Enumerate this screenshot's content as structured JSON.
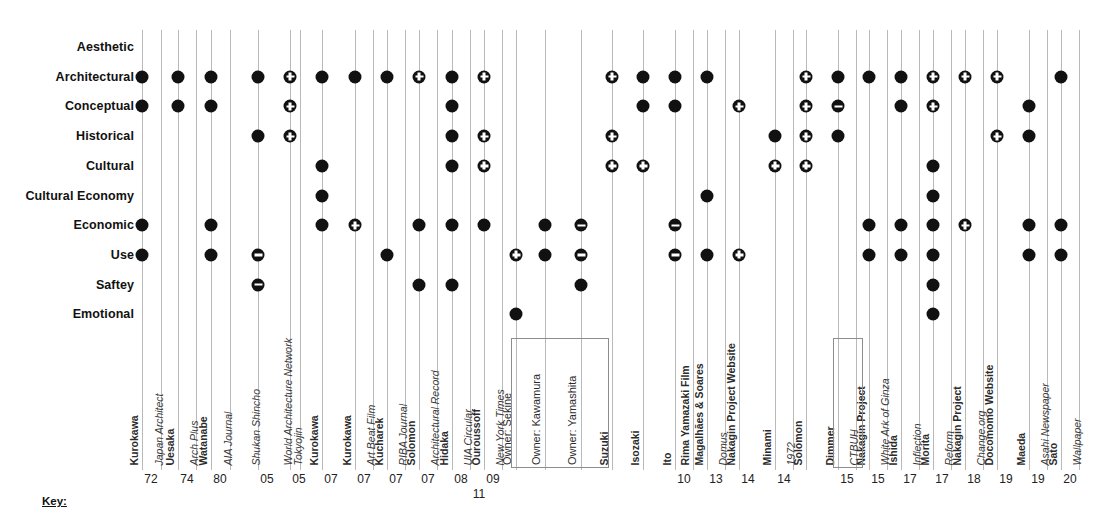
{
  "chart_data": {
    "type": "scatter",
    "title": "",
    "xlabel": "",
    "ylabel": "",
    "grid": true,
    "legend": "none",
    "rows": [
      "Aesthetic",
      "Architectural",
      "Conceptual",
      "Historical",
      "Cultural",
      "Cultural Economy",
      "Economic",
      "Use",
      "Saftey",
      "Emotional"
    ],
    "marker_types": {
      "filled": "filled circle",
      "plus": "circle with plus",
      "minus": "circle with minus"
    },
    "columns": [
      {
        "person": "Kurokawa",
        "source": "",
        "year": "72",
        "x": 142,
        "points": [
          {
            "row": "Architectural",
            "marker": "filled"
          },
          {
            "row": "Conceptual",
            "marker": "filled"
          },
          {
            "row": "Economic",
            "marker": "filled"
          },
          {
            "row": "Use",
            "marker": "filled"
          }
        ]
      },
      {
        "person": "",
        "source": "Japan Architect",
        "year": "",
        "x": 161,
        "points": []
      },
      {
        "person": "Uesaka",
        "source": "",
        "year": "74",
        "x": 178,
        "points": [
          {
            "row": "Architectural",
            "marker": "filled"
          },
          {
            "row": "Conceptual",
            "marker": "filled"
          }
        ]
      },
      {
        "person": "",
        "source": "Arch Plus",
        "year": "",
        "x": 196,
        "points": []
      },
      {
        "person": "Watanabe",
        "source": "",
        "year": "80",
        "x": 211,
        "points": [
          {
            "row": "Architectural",
            "marker": "filled"
          },
          {
            "row": "Conceptual",
            "marker": "filled"
          },
          {
            "row": "Economic",
            "marker": "filled"
          },
          {
            "row": "Use",
            "marker": "filled"
          }
        ]
      },
      {
        "person": "",
        "source": "AIA Journal",
        "year": "",
        "x": 230,
        "points": []
      },
      {
        "person": "",
        "source": "Shukan Shincho",
        "year": "05",
        "x": 258,
        "points": [
          {
            "row": "Architectural",
            "marker": "filled"
          },
          {
            "row": "Historical",
            "marker": "filled"
          },
          {
            "row": "Use",
            "marker": "minus"
          },
          {
            "row": "Saftey",
            "marker": "minus"
          }
        ]
      },
      {
        "person": "",
        "source": "World Architecture Network",
        "year": "05",
        "x": 290,
        "points": [
          {
            "row": "Architectural",
            "marker": "plus"
          },
          {
            "row": "Conceptual",
            "marker": "plus"
          },
          {
            "row": "Historical",
            "marker": "plus"
          }
        ]
      },
      {
        "person": "Kurokawa",
        "source": "",
        "year": "07",
        "x": 322,
        "points": [
          {
            "row": "Architectural",
            "marker": "filled"
          },
          {
            "row": "Cultural",
            "marker": "filled"
          },
          {
            "row": "Cultural Economy",
            "marker": "filled"
          },
          {
            "row": "Economic",
            "marker": "filled"
          }
        ]
      },
      {
        "person": "",
        "source": "Tokyojin",
        "year": "",
        "x": 300,
        "points": []
      },
      {
        "person": "Kurokawa",
        "source": "",
        "year": "07",
        "x": 355,
        "points": [
          {
            "row": "Architectural",
            "marker": "filled"
          },
          {
            "row": "Economic",
            "marker": "plus"
          }
        ]
      },
      {
        "person": "",
        "source": "Art Beat Film",
        "year": "",
        "x": 373,
        "points": []
      },
      {
        "person": "Kucharek",
        "source": "",
        "year": "07",
        "x": 387,
        "points": [
          {
            "row": "Architectural",
            "marker": "filled"
          },
          {
            "row": "Use",
            "marker": "filled"
          }
        ]
      },
      {
        "person": "",
        "source": "RIBA Journal",
        "year": "",
        "x": 405,
        "points": []
      },
      {
        "person": "Solomon",
        "source": "",
        "year": "07",
        "x": 419,
        "points": [
          {
            "row": "Architectural",
            "marker": "plus"
          },
          {
            "row": "Economic",
            "marker": "filled"
          },
          {
            "row": "Saftey",
            "marker": "filled"
          }
        ]
      },
      {
        "person": "",
        "source": "Architectural Record",
        "year": "",
        "x": 437,
        "points": []
      },
      {
        "person": "Hidaka",
        "source": "",
        "year": "08",
        "x": 452,
        "points": [
          {
            "row": "Architectural",
            "marker": "filled"
          },
          {
            "row": "Conceptual",
            "marker": "filled"
          },
          {
            "row": "Historical",
            "marker": "filled"
          },
          {
            "row": "Cultural",
            "marker": "filled"
          },
          {
            "row": "Economic",
            "marker": "filled"
          },
          {
            "row": "Saftey",
            "marker": "filled"
          }
        ]
      },
      {
        "person": "",
        "source": "UIA Circular",
        "year": "11",
        "x": 470,
        "points": []
      },
      {
        "person": "Ouroussoff",
        "source": "",
        "year": "09",
        "x": 484,
        "points": [
          {
            "row": "Architectural",
            "marker": "plus"
          },
          {
            "row": "Historical",
            "marker": "plus"
          },
          {
            "row": "Cultural",
            "marker": "plus"
          },
          {
            "row": "Economic",
            "marker": "filled"
          }
        ]
      },
      {
        "person": "",
        "source": "New York Times",
        "year": "",
        "x": 502,
        "points": []
      },
      {
        "person": "Owner: Sekine",
        "source": "",
        "year": "",
        "x": 516,
        "points": [
          {
            "row": "Use",
            "marker": "plus"
          },
          {
            "row": "Emotional",
            "marker": "filled"
          }
        ]
      },
      {
        "person": "Owner: Kawamura",
        "source": "",
        "year": "",
        "x": 545,
        "points": [
          {
            "row": "Economic",
            "marker": "filled"
          },
          {
            "row": "Use",
            "marker": "filled"
          }
        ]
      },
      {
        "person": "Owner: Yamashita",
        "source": "",
        "year": "",
        "x": 581,
        "points": [
          {
            "row": "Economic",
            "marker": "minus"
          },
          {
            "row": "Use",
            "marker": "minus"
          },
          {
            "row": "Saftey",
            "marker": "filled"
          }
        ]
      },
      {
        "person": "Suzuki",
        "source": "",
        "year": "",
        "x": 612,
        "points": [
          {
            "row": "Architectural",
            "marker": "plus"
          },
          {
            "row": "Historical",
            "marker": "plus"
          },
          {
            "row": "Cultural",
            "marker": "plus"
          }
        ]
      },
      {
        "person": "Isozaki",
        "source": "",
        "year": "",
        "x": 643,
        "points": [
          {
            "row": "Architectural",
            "marker": "filled"
          },
          {
            "row": "Conceptual",
            "marker": "filled"
          },
          {
            "row": "Cultural",
            "marker": "plus"
          }
        ]
      },
      {
        "person": "Ito",
        "source": "",
        "year": "10",
        "x": 675,
        "points": [
          {
            "row": "Architectural",
            "marker": "filled"
          },
          {
            "row": "Conceptual",
            "marker": "filled"
          },
          {
            "row": "Economic",
            "marker": "minus"
          },
          {
            "row": "Use",
            "marker": "minus"
          }
        ]
      },
      {
        "person": "Rima Yamazaki Film",
        "source": "",
        "year": "",
        "x": 693,
        "points": []
      },
      {
        "person": "Magalhães & Soares",
        "source": "",
        "year": "13",
        "x": 707,
        "points": [
          {
            "row": "Architectural",
            "marker": "filled"
          },
          {
            "row": "Cultural Economy",
            "marker": "filled"
          },
          {
            "row": "Use",
            "marker": "filled"
          }
        ]
      },
      {
        "person": "",
        "source": "Domus",
        "year": "",
        "x": 725,
        "points": []
      },
      {
        "person": "Nakagin Project Website",
        "source": "",
        "year": "14",
        "x": 739,
        "points": [
          {
            "row": "Conceptual",
            "marker": "plus"
          },
          {
            "row": "Use",
            "marker": "plus"
          }
        ]
      },
      {
        "person": "Minami",
        "source": "",
        "year": "14",
        "x": 775,
        "points": [
          {
            "row": "Historical",
            "marker": "filled"
          },
          {
            "row": "Cultural",
            "marker": "plus"
          }
        ]
      },
      {
        "person": "",
        "source": "1972",
        "year": "",
        "x": 793,
        "points": []
      },
      {
        "person": "Solomon",
        "source": "",
        "year": "",
        "x": 806,
        "points": [
          {
            "row": "Architectural",
            "marker": "plus"
          },
          {
            "row": "Conceptual",
            "marker": "plus"
          },
          {
            "row": "Historical",
            "marker": "plus"
          },
          {
            "row": "Cultural",
            "marker": "plus"
          }
        ]
      },
      {
        "person": "Dimmer",
        "source": "",
        "year": "15",
        "x": 838,
        "points": [
          {
            "row": "Architectural",
            "marker": "filled"
          },
          {
            "row": "Conceptual",
            "marker": "minus"
          },
          {
            "row": "Historical",
            "marker": "filled"
          }
        ]
      },
      {
        "person": "",
        "source": "CTBUH",
        "year": "",
        "x": 856,
        "points": []
      },
      {
        "person": "Nakagin Project",
        "source": "",
        "year": "15",
        "x": 869,
        "points": [
          {
            "row": "Architectural",
            "marker": "filled"
          },
          {
            "row": "Economic",
            "marker": "filled"
          },
          {
            "row": "Use",
            "marker": "filled"
          }
        ]
      },
      {
        "person": "",
        "source": "White Ark of Ginza",
        "year": "",
        "x": 887,
        "points": []
      },
      {
        "person": "Ishida",
        "source": "",
        "year": "17",
        "x": 901,
        "points": [
          {
            "row": "Architectural",
            "marker": "filled"
          },
          {
            "row": "Conceptual",
            "marker": "filled"
          },
          {
            "row": "Economic",
            "marker": "filled"
          },
          {
            "row": "Use",
            "marker": "filled"
          }
        ]
      },
      {
        "person": "",
        "source": "Inflection",
        "year": "",
        "x": 919,
        "points": []
      },
      {
        "person": "Morita",
        "source": "",
        "year": "17",
        "x": 933,
        "points": [
          {
            "row": "Architectural",
            "marker": "plus"
          },
          {
            "row": "Conceptual",
            "marker": "plus"
          },
          {
            "row": "Cultural",
            "marker": "filled"
          },
          {
            "row": "Cultural Economy",
            "marker": "filled"
          },
          {
            "row": "Economic",
            "marker": "filled"
          },
          {
            "row": "Use",
            "marker": "filled"
          },
          {
            "row": "Saftey",
            "marker": "filled"
          },
          {
            "row": "Emotional",
            "marker": "filled"
          }
        ]
      },
      {
        "person": "",
        "source": "Reform",
        "year": "",
        "x": 951,
        "points": []
      },
      {
        "person": "Nakagin Project",
        "source": "",
        "year": "18",
        "x": 965,
        "points": [
          {
            "row": "Architectural",
            "marker": "plus"
          },
          {
            "row": "Economic",
            "marker": "plus"
          }
        ]
      },
      {
        "person": "",
        "source": "Change.org",
        "year": "",
        "x": 983,
        "points": []
      },
      {
        "person": "Docomomo Website",
        "source": "",
        "year": "19",
        "x": 997,
        "points": [
          {
            "row": "Architectural",
            "marker": "plus"
          },
          {
            "row": "Historical",
            "marker": "plus"
          }
        ]
      },
      {
        "person": "Maeda",
        "source": "",
        "year": "19",
        "x": 1029,
        "points": [
          {
            "row": "Conceptual",
            "marker": "filled"
          },
          {
            "row": "Historical",
            "marker": "filled"
          },
          {
            "row": "Economic",
            "marker": "filled"
          },
          {
            "row": "Use",
            "marker": "filled"
          }
        ]
      },
      {
        "person": "",
        "source": "Asahi Newspaper",
        "year": "",
        "x": 1047,
        "points": []
      },
      {
        "person": "Sato",
        "source": "",
        "year": "20",
        "x": 1061,
        "points": [
          {
            "row": "Architectural",
            "marker": "filled"
          },
          {
            "row": "Economic",
            "marker": "filled"
          },
          {
            "row": "Use",
            "marker": "filled"
          }
        ]
      },
      {
        "person": "",
        "source": "Wallpaper",
        "year": "",
        "x": 1079,
        "points": []
      }
    ],
    "group_boxes": [
      {
        "label": "owner-group",
        "x": 511,
        "width": 96
      },
      {
        "label": "dimmer-group",
        "x": 833,
        "width": 28
      }
    ]
  },
  "key": {
    "label": "Key:"
  }
}
